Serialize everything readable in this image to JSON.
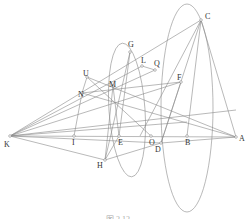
{
  "diagram": {
    "type": "geometry-construction",
    "points": [
      {
        "id": "K",
        "x": 10,
        "y": 136,
        "lx": 4,
        "ly": 147
      },
      {
        "id": "A",
        "x": 236,
        "y": 137,
        "lx": 239,
        "ly": 141
      },
      {
        "id": "C",
        "x": 201,
        "y": 20,
        "lx": 205,
        "ly": 19
      },
      {
        "id": "G",
        "x": 130,
        "y": 52,
        "lx": 128,
        "ly": 47
      },
      {
        "id": "L",
        "x": 142,
        "y": 66,
        "lx": 141,
        "ly": 63
      },
      {
        "id": "Q",
        "x": 155,
        "y": 70,
        "lx": 154,
        "ly": 66
      },
      {
        "id": "F",
        "x": 181,
        "y": 82,
        "lx": 177,
        "ly": 80
      },
      {
        "id": "U",
        "x": 87,
        "y": 77,
        "lx": 83,
        "ly": 76
      },
      {
        "id": "N",
        "x": 82,
        "y": 93,
        "lx": 78,
        "ly": 97
      },
      {
        "id": "M",
        "x": 113,
        "y": 86,
        "lx": 109,
        "ly": 87
      },
      {
        "id": "I",
        "x": 74,
        "y": 136,
        "lx": 72,
        "ly": 145
      },
      {
        "id": "E",
        "x": 119,
        "y": 136,
        "lx": 118,
        "ly": 145
      },
      {
        "id": "O",
        "x": 151,
        "y": 136,
        "lx": 149,
        "ly": 145
      },
      {
        "id": "B",
        "x": 187,
        "y": 136,
        "lx": 185,
        "ly": 145
      },
      {
        "id": "H",
        "x": 105,
        "y": 160,
        "lx": 97,
        "ly": 168
      },
      {
        "id": "D",
        "x": 161,
        "y": 143,
        "lx": 155,
        "ly": 152
      }
    ],
    "caption": "图 2.12"
  }
}
